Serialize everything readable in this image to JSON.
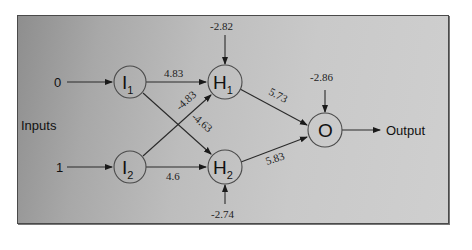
{
  "diagram": {
    "type": "neural-network",
    "inputs_label": "Inputs",
    "output_label": "Output",
    "input_values": [
      {
        "node": "I1",
        "value": "0"
      },
      {
        "node": "I2",
        "value": "1"
      }
    ],
    "nodes": [
      {
        "id": "I1",
        "letter": "I",
        "sub": "1",
        "layer": "input"
      },
      {
        "id": "I2",
        "letter": "I",
        "sub": "2",
        "layer": "input"
      },
      {
        "id": "H1",
        "letter": "H",
        "sub": "1",
        "layer": "hidden",
        "bias": "-2.82"
      },
      {
        "id": "H2",
        "letter": "H",
        "sub": "2",
        "layer": "hidden",
        "bias": "-2.74"
      },
      {
        "id": "O",
        "letter": "O",
        "sub": "",
        "layer": "output",
        "bias": "-2.86"
      }
    ],
    "edges": [
      {
        "from": "I1",
        "to": "H1",
        "weight": "4.83"
      },
      {
        "from": "I2",
        "to": "H1",
        "weight": "-4.83"
      },
      {
        "from": "I1",
        "to": "H2",
        "weight": "-4.63"
      },
      {
        "from": "I2",
        "to": "H2",
        "weight": "4.6"
      },
      {
        "from": "H1",
        "to": "O",
        "weight": "5.73"
      },
      {
        "from": "H2",
        "to": "O",
        "weight": "5.83"
      }
    ]
  },
  "colors": {
    "line": "#2a2a2a",
    "node_stroke": "#4a4a4a",
    "text": "#111111"
  }
}
